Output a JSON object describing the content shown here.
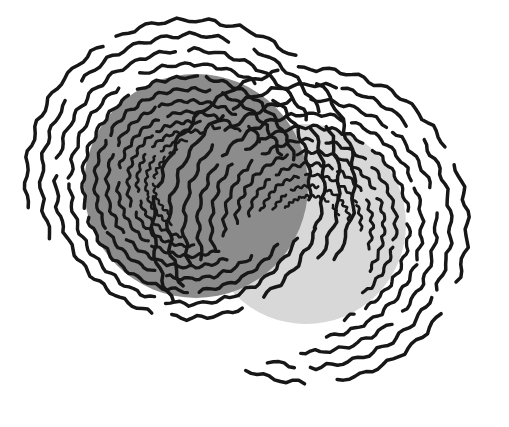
{
  "canvas": {
    "width": 509,
    "height": 427,
    "background_color": "#ffffff",
    "title": "Two overlapping shaded discs with concentric hand-drawn contour rings"
  },
  "palette": {
    "background": "#ffffff",
    "disc_dark": "#8c8c8c",
    "disc_light": "#d8d8d8",
    "stroke": "#171717"
  },
  "discs": [
    {
      "name": "left-dark-disc",
      "label": "Left shaded disc",
      "cx": 196,
      "cy": 186,
      "r": 112,
      "fill": "#8c8c8c",
      "z": 2
    },
    {
      "name": "right-light-disc",
      "label": "Right shaded disc",
      "cx": 306,
      "cy": 224,
      "r": 100,
      "fill": "#d8d8d8",
      "z": 1
    }
  ],
  "ring_families": [
    {
      "name": "left-ring-family",
      "label": "Left concentric ring family",
      "cx": 190,
      "cy": 184,
      "stroke": "#171717",
      "rings": [
        {
          "r": 36,
          "start_deg": 120,
          "end_deg": 250,
          "width": 2.4,
          "wobble": 1.2
        },
        {
          "r": 44,
          "start_deg": 105,
          "end_deg": 268,
          "width": 2.6,
          "wobble": 1.3
        },
        {
          "r": 53,
          "start_deg": 92,
          "end_deg": 286,
          "width": 2.8,
          "wobble": 1.4
        },
        {
          "r": 62,
          "start_deg": 80,
          "end_deg": 300,
          "width": 3.0,
          "wobble": 1.5
        },
        {
          "r": 72,
          "start_deg": 66,
          "end_deg": 315,
          "width": 3.1,
          "wobble": 1.5
        },
        {
          "r": 83,
          "start_deg": 54,
          "end_deg": 330,
          "width": 3.2,
          "wobble": 1.6
        },
        {
          "r": 95,
          "start_deg": 42,
          "end_deg": 344,
          "width": 3.3,
          "wobble": 1.7
        },
        {
          "r": 107,
          "start_deg": 30,
          "end_deg": 356,
          "width": 3.4,
          "wobble": 1.7
        },
        {
          "r": 120,
          "start_deg": 20,
          "end_deg": 368,
          "width": 3.4,
          "wobble": 1.8
        },
        {
          "r": 134,
          "start_deg": 14,
          "end_deg": 380,
          "width": 3.5,
          "wobble": 1.9
        },
        {
          "r": 149,
          "start_deg": 150,
          "end_deg": 392,
          "width": 3.5,
          "wobble": 2.0
        },
        {
          "r": 164,
          "start_deg": 162,
          "end_deg": 388,
          "width": 3.5,
          "wobble": 2.1
        }
      ]
    },
    {
      "name": "right-ring-family",
      "label": "Right concentric ring family",
      "cx": 310,
      "cy": 226,
      "stroke": "#171717",
      "rings": [
        {
          "r": 30,
          "start_deg": 210,
          "end_deg": 340,
          "width": 2.4,
          "wobble": 1.2
        },
        {
          "r": 40,
          "start_deg": 200,
          "end_deg": 352,
          "width": 2.6,
          "wobble": 1.3
        },
        {
          "r": 51,
          "start_deg": 192,
          "end_deg": 366,
          "width": 2.8,
          "wobble": 1.4
        },
        {
          "r": 62,
          "start_deg": 184,
          "end_deg": 382,
          "width": 3.0,
          "wobble": 1.5
        },
        {
          "r": 74,
          "start_deg": 176,
          "end_deg": 398,
          "width": 3.1,
          "wobble": 1.6
        },
        {
          "r": 86,
          "start_deg": 170,
          "end_deg": 414,
          "width": 3.2,
          "wobble": 1.6
        },
        {
          "r": 99,
          "start_deg": 164,
          "end_deg": 430,
          "width": 3.3,
          "wobble": 1.7
        },
        {
          "r": 112,
          "start_deg": 160,
          "end_deg": 444,
          "width": 3.4,
          "wobble": 1.8
        },
        {
          "r": 126,
          "start_deg": 156,
          "end_deg": 456,
          "width": 3.4,
          "wobble": 1.9
        },
        {
          "r": 141,
          "start_deg": 152,
          "end_deg": 468,
          "width": 3.5,
          "wobble": 2.0
        },
        {
          "r": 157,
          "start_deg": 150,
          "end_deg": 474,
          "width": 3.5,
          "wobble": 2.1
        }
      ]
    }
  ],
  "render": {
    "segment_gap_deg": 7,
    "segment_span_deg": 52,
    "wobble_period_deg": 11,
    "sample_step_deg": 2.2,
    "random_seed": 20240607
  },
  "legend": {
    "visible": false,
    "entries": []
  },
  "annotations": []
}
